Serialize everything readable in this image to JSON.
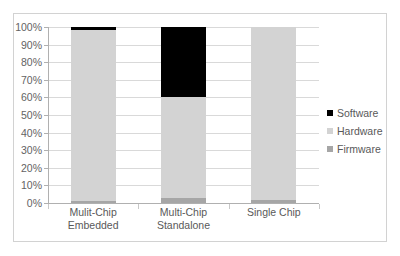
{
  "chart_data": {
    "type": "bar",
    "subtype": "stacked-column-100",
    "title": "",
    "xlabel": "",
    "ylabel": "",
    "grid": true,
    "legend_position": "right",
    "ylim": [
      0,
      100
    ],
    "y_tick_labels": [
      "100%",
      "90%",
      "80%",
      "70%",
      "60%",
      "50%",
      "40%",
      "30%",
      "20%",
      "10%",
      "0%"
    ],
    "y_tick_values": [
      100,
      90,
      80,
      70,
      60,
      50,
      40,
      30,
      20,
      10,
      0
    ],
    "categories": [
      "Mulit-Chip Embedded",
      "Multi-Chip Standalone",
      "Single Chip"
    ],
    "category_lines": [
      [
        "Mulit-Chip",
        "Embedded"
      ],
      [
        "Multi-Chip",
        "Standalone"
      ],
      [
        "Single Chip",
        ""
      ]
    ],
    "series": [
      {
        "name": "Firmware",
        "color": "#a6a6a6",
        "values": [
          1,
          3,
          1.5
        ]
      },
      {
        "name": "Hardware",
        "color": "#d3d3d3",
        "values": [
          97.5,
          57,
          98.5
        ]
      },
      {
        "name": "Software",
        "color": "#000000",
        "values": [
          1.5,
          40,
          0
        ]
      }
    ]
  },
  "legend": {
    "items": [
      {
        "label": "Software",
        "color": "#000000"
      },
      {
        "label": "Hardware",
        "color": "#d3d3d3"
      },
      {
        "label": "Firmware",
        "color": "#a6a6a6"
      }
    ]
  },
  "colors": {
    "software": "#000000",
    "hardware": "#d3d3d3",
    "firmware": "#a6a6a6",
    "gridline": "#d9d9d9",
    "axis": "#b0b0b0",
    "border": "#d2d2d2",
    "text": "#595959"
  }
}
